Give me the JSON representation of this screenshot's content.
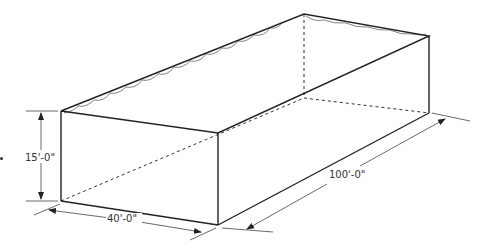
{
  "diagram": {
    "dimensions": {
      "height": "15'-0\"",
      "width": "40'-0\"",
      "length": "100'-0\""
    },
    "colors": {
      "line": "#222222",
      "background": "#ffffff"
    }
  }
}
